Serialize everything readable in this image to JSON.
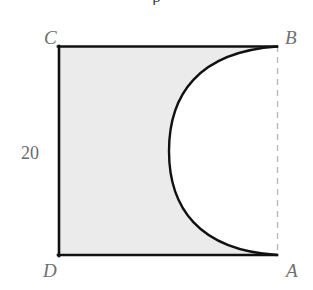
{
  "figure": {
    "kind": "geometry-diagram",
    "caption_remnant": "p",
    "labels": {
      "vertex_top_left": "C",
      "vertex_top_right": "B",
      "vertex_bottom_left": "D",
      "vertex_bottom_right": "A",
      "side_length": "20"
    },
    "colors": {
      "stroke": "#111111",
      "shaded_fill": "#ebebeb",
      "unshaded_fill": "#ffffff",
      "dashed_edge": "#b9b9b9",
      "label_text": "#6f6f6f",
      "measure_text": "#6a6a6a",
      "background": "#ffffff"
    },
    "geometry": {
      "square": {
        "left": 58,
        "top": 46,
        "right": 277,
        "bottom": 256,
        "width": 219,
        "height": 210
      },
      "solid_edges": [
        "top CB",
        "left CD",
        "bottom DA"
      ],
      "dashed_edges": [
        "right BA"
      ],
      "arc": {
        "from": "B",
        "to": "A",
        "bulge_direction": "left",
        "leftmost_x": 169,
        "leftmost_y": 151,
        "start_x": 277,
        "start_y": 46,
        "end_x": 277,
        "end_y": 256
      }
    }
  }
}
